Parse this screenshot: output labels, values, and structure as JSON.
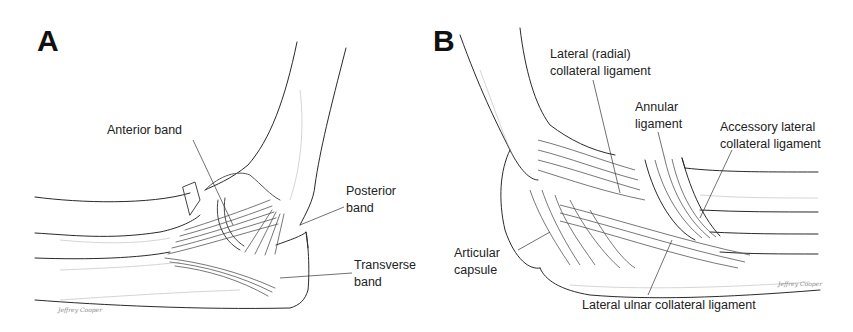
{
  "figure": {
    "panels": [
      {
        "letter": "A",
        "labels": {
          "anterior_band": "Anterior band",
          "posterior_band_1": "Posterior",
          "posterior_band_2": "band",
          "transverse_band_1": "Transverse",
          "transverse_band_2": "band"
        },
        "signature": "Jeffrey Cooper"
      },
      {
        "letter": "B",
        "labels": {
          "lateral_radial_1": "Lateral (radial)",
          "lateral_radial_2": "collateral ligament",
          "annular_1": "Annular",
          "annular_2": "ligament",
          "accessory_1": "Accessory lateral",
          "accessory_2": "collateral ligament",
          "articular_1": "Articular",
          "articular_2": "capsule",
          "lateral_ulnar": "Lateral ulnar collateral ligament"
        },
        "signature": "Jeffrey Cooper"
      }
    ],
    "colors": {
      "ink": "#2a2a2a",
      "shade": "#9a9a9a",
      "background": "#ffffff"
    }
  }
}
